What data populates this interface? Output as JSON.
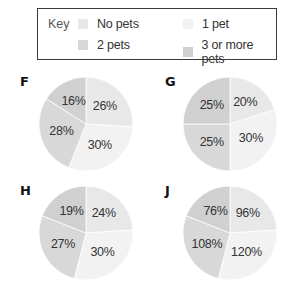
{
  "key": {
    "title": "Key",
    "items": [
      {
        "label": "No pets",
        "color": "#e8e8e8"
      },
      {
        "label": "1 pet",
        "color": "#f2f2f2"
      },
      {
        "label": "2 pets",
        "color": "#d8d8d8"
      },
      {
        "label": "3 or more pets",
        "color": "#d0d0d0"
      }
    ]
  },
  "chart_data": [
    {
      "type": "pie",
      "title": "F",
      "categories": [
        "No pets",
        "1 pet",
        "2 pets",
        "3 or more pets"
      ],
      "values": [
        26,
        30,
        28,
        16
      ],
      "labels": [
        "26%",
        "30%",
        "28%",
        "16%"
      ]
    },
    {
      "type": "pie",
      "title": "G",
      "categories": [
        "No pets",
        "1 pet",
        "2 pets",
        "3 or more pets"
      ],
      "values": [
        20,
        30,
        25,
        25
      ],
      "labels": [
        "20%",
        "30%",
        "25%",
        "25%"
      ]
    },
    {
      "type": "pie",
      "title": "H",
      "categories": [
        "No pets",
        "1 pet",
        "2 pets",
        "3 or more pets"
      ],
      "values": [
        24,
        30,
        27,
        19
      ],
      "labels": [
        "24%",
        "30%",
        "27%",
        "19%"
      ]
    },
    {
      "type": "pie",
      "title": "J",
      "categories": [
        "No pets",
        "1 pet",
        "2 pets",
        "3 or more pets"
      ],
      "values": [
        96,
        120,
        108,
        76
      ],
      "labels": [
        "96%",
        "120%",
        "108%",
        "76%"
      ]
    }
  ]
}
